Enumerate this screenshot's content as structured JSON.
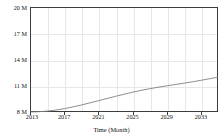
{
  "chart_data": {
    "type": "line",
    "title": "",
    "xlabel": "Time (Month)",
    "ylabel": "",
    "grid": true,
    "legend": false,
    "xlim": [
      2013,
      2035
    ],
    "ylim": [
      8000000,
      20000000
    ],
    "y_ticks": [
      8000000,
      11000000,
      14000000,
      17000000,
      20000000
    ],
    "y_tick_labels": [
      "8 M",
      "11 M",
      "14 M",
      "17 M",
      "20 M"
    ],
    "x_ticks": [
      2013,
      2017,
      2021,
      2025,
      2029,
      2033
    ],
    "x_tick_labels": [
      "2013",
      "2017",
      "2021",
      "2025",
      "2029",
      "2033"
    ],
    "series": [
      {
        "name": "value",
        "color": "#808080",
        "x": [
          2013,
          2014,
          2015,
          2016,
          2017,
          2018,
          2019,
          2020,
          2021,
          2022,
          2023,
          2024,
          2025,
          2026,
          2027,
          2028,
          2029,
          2030,
          2031,
          2032,
          2033,
          2034,
          2035
        ],
        "values": [
          8000000,
          8030000,
          8100000,
          8220000,
          8380000,
          8580000,
          8800000,
          9040000,
          9290000,
          9540000,
          9790000,
          10030000,
          10260000,
          10470000,
          10660000,
          10830000,
          10990000,
          11140000,
          11290000,
          11450000,
          11620000,
          11800000,
          11980000
        ]
      }
    ]
  },
  "axis": {
    "y_labels": [
      "20 M",
      "17 M",
      "14 M",
      "11 M",
      "8 M"
    ],
    "x_labels": [
      "2013",
      "2017",
      "2021",
      "2025",
      "2029",
      "2033"
    ],
    "x_title": "Time (Month)"
  },
  "title_text": ""
}
